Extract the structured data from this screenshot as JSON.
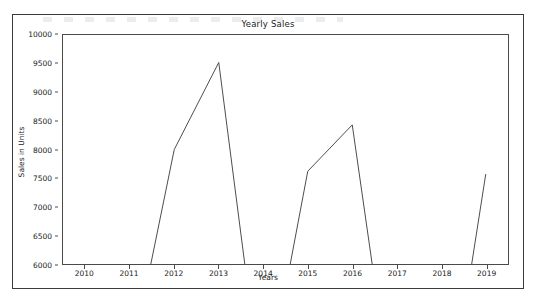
{
  "chart_data": {
    "type": "line",
    "title": "Yearly Sales",
    "xlabel": "Years",
    "ylabel": "Sales in Units",
    "x": [
      2010,
      2011,
      2012,
      2013,
      2014,
      2015,
      2016,
      2017,
      2018,
      2019
    ],
    "values": [
      3100,
      4200,
      8000,
      9520,
      3500,
      7620,
      8430,
      3000,
      2600,
      7570
    ],
    "series": [
      {
        "name": "Sales in Units",
        "values": [
          3100,
          4200,
          8000,
          9520,
          3500,
          7620,
          8430,
          3000,
          2600,
          7570
        ]
      }
    ],
    "xlim": [
      2009.5,
      2019.5
    ],
    "ylim": [
      6000,
      10000
    ],
    "xticks": [
      2010,
      2011,
      2012,
      2013,
      2014,
      2015,
      2016,
      2017,
      2018,
      2019
    ],
    "xtick_labels": [
      "2010",
      "2011",
      "2012",
      "2013",
      "2014",
      "2015",
      "2016",
      "2017",
      "2018",
      "2019"
    ],
    "yticks": [
      6000,
      6500,
      7000,
      7500,
      8000,
      8500,
      9000,
      9500,
      10000
    ],
    "ytick_labels": [
      "6000",
      "6500",
      "7000",
      "7500",
      "8000",
      "8500",
      "9000",
      "9500",
      "10000"
    ],
    "grid": false,
    "legend": null,
    "line_color": "#4d4d4d",
    "line_width": 1,
    "note": "Line is clipped at the y-axis lower bound of 6000; segments for 2010, 2011, 2014, 2017 and 2018 fall below the visible range."
  },
  "figure": {
    "background": "#ffffff",
    "border_color": "#3b3b3b",
    "axes_color": "#4a4a4a"
  }
}
